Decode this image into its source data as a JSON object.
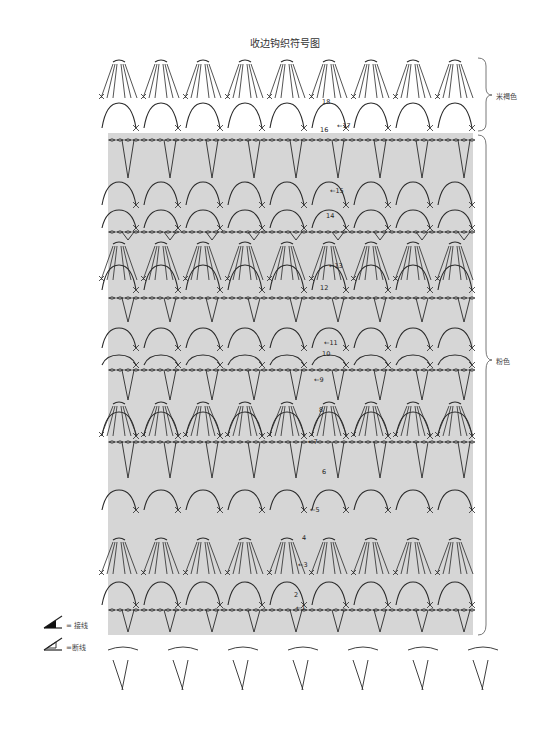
{
  "title": "收边钩织符号图",
  "brace_labels": [
    {
      "label": "米褐色",
      "rows": "17-18"
    },
    {
      "label": "粉色",
      "rows": "1-16"
    }
  ],
  "row_numbers": [
    "1",
    "2",
    "3",
    "4",
    "5",
    "6",
    "7",
    "8",
    "9",
    "10",
    "11",
    "12",
    "13",
    "14",
    "15",
    "16",
    "17",
    "18"
  ],
  "legend": [
    {
      "icon": "join-yarn-icon",
      "label": "= 接线"
    },
    {
      "icon": "cut-yarn-icon",
      "label": "=断线"
    }
  ],
  "colors": {
    "pink_section_bg": "#d6d6d6",
    "stitch_line": "#2a2a2a",
    "page_bg": "#ffffff"
  }
}
